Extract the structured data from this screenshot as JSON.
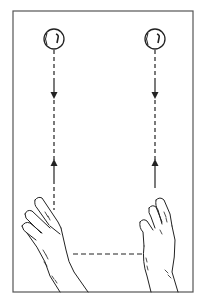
{
  "diagram": {
    "colors": {
      "ink": "#222222",
      "frame": "#555555",
      "background": "#ffffff"
    },
    "frame": {
      "x": 13,
      "y": 11,
      "width": 180,
      "height": 281
    },
    "balls": [
      {
        "id": "left-ball",
        "cx": 54,
        "cy": 39,
        "r": 10
      },
      {
        "id": "right-ball",
        "cx": 155,
        "cy": 39,
        "r": 10
      }
    ],
    "paths": [
      {
        "id": "left-path",
        "x": 54,
        "y_top": 50,
        "y_bottom": 218,
        "arrow_down_y": 96,
        "arrow_up_y": 162
      },
      {
        "id": "right-path",
        "x": 155,
        "y_top": 50,
        "y_bottom": 218,
        "arrow_down_y": 96,
        "arrow_up_y": 162
      }
    ],
    "hand_link": {
      "id": "hand-transfer-line",
      "x1": 73,
      "x2": 143,
      "y": 254
    },
    "hands": [
      {
        "id": "left-hand",
        "side": "left"
      },
      {
        "id": "right-hand",
        "side": "right"
      }
    ]
  }
}
